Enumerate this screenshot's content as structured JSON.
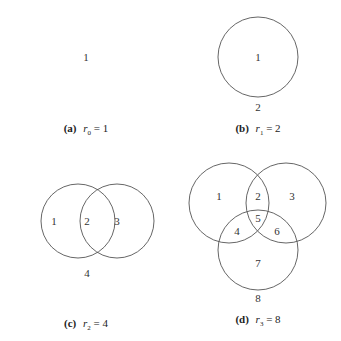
{
  "panels": [
    {
      "id": "a",
      "caption_label": "(a)",
      "caption_var": "r",
      "caption_sub": "0",
      "caption_eq": " = 1",
      "regions": [
        "1"
      ]
    },
    {
      "id": "b",
      "caption_label": "(b)",
      "caption_var": "r",
      "caption_sub": "1",
      "caption_eq": " = 2",
      "regions": [
        "1",
        "2"
      ]
    },
    {
      "id": "c",
      "caption_label": "(c)",
      "caption_var": "r",
      "caption_sub": "2",
      "caption_eq": " = 4",
      "regions": [
        "1",
        "2",
        "3",
        "4"
      ]
    },
    {
      "id": "d",
      "caption_label": "(d)",
      "caption_var": "r",
      "caption_sub": "3",
      "caption_eq": " = 8",
      "regions": [
        "1",
        "2",
        "3",
        "4",
        "5",
        "6",
        "7",
        "8"
      ]
    }
  ]
}
